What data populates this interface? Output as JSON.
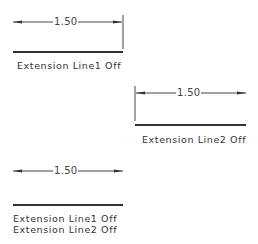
{
  "diagrams": [
    {
      "dimension_value": "1.50",
      "labels": [
        "Extension Line1 Off"
      ]
    },
    {
      "dimension_value": "1.50",
      "labels": [
        "Extension Line2 Off"
      ]
    },
    {
      "dimension_value": "1.50",
      "labels": [
        "Extension Line1 Off",
        "Extension Line2 Off"
      ]
    }
  ],
  "colors": {
    "line": "#333333",
    "text": "#333333",
    "background": "#ffffff"
  }
}
